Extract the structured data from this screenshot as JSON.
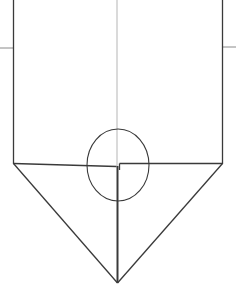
{
  "diagram": {
    "colors": {
      "background": "#ffffff",
      "stroke_dark": "#3a3a3a",
      "stroke_light": "#9a9a9a"
    },
    "width": 236,
    "height": 301
  }
}
